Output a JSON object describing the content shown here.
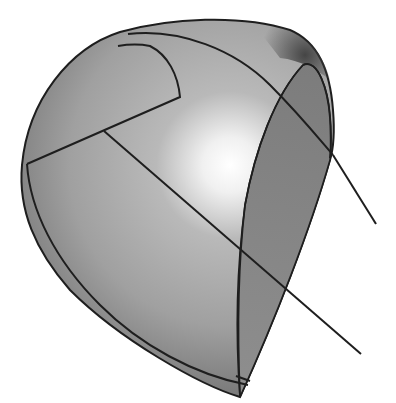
{
  "figure": {
    "colors": {
      "background": "#ffffff",
      "surface_light": "#ffffff",
      "surface_mid": "#a8a8a8",
      "surface_dark": "#6e6e6e",
      "strip": "#8a8a8a",
      "edge": "#1e1e1e"
    }
  }
}
